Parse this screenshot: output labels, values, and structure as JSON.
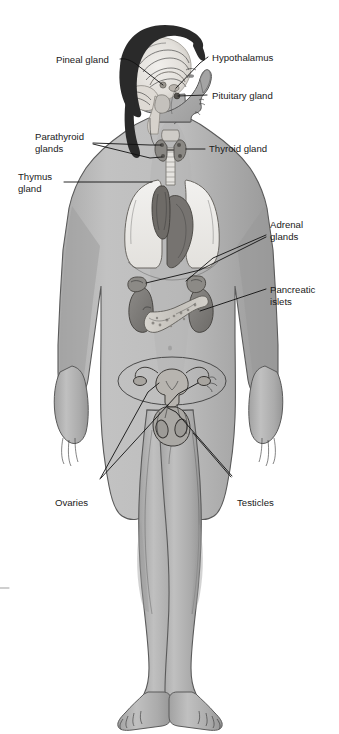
{
  "figure": {
    "name": "endocrine-system-diagram",
    "background_color": "#ffffff",
    "body_fill": "#b8b8b8",
    "body_shadow": "#9d9d9d",
    "outline_color": "#4a4a4a",
    "label_color": "#1a1a1a",
    "leader_color": "#111111"
  },
  "labels": {
    "pineal": "Pineal gland",
    "hypothalamus": "Hypothalamus",
    "pituitary": "Pituitary gland",
    "parathyroid_line1": "Parathyroid",
    "parathyroid_line2": "glands",
    "thyroid": "Thyroid gland",
    "thymus_line1": "Thymus",
    "thymus_line2": "gland",
    "adrenal_line1": "Adrenal",
    "adrenal_line2": "glands",
    "pancreatic_line1": "Pancreatic",
    "pancreatic_line2": "islets",
    "ovaries": "Ovaries",
    "testicles": "Testicles"
  },
  "organs": [
    {
      "name": "pineal-gland",
      "label": "Pineal gland",
      "region": "brain",
      "fill": "#e8e6e2"
    },
    {
      "name": "hypothalamus",
      "label": "Hypothalamus",
      "region": "brain",
      "fill": "#ddd9d3"
    },
    {
      "name": "pituitary-gland",
      "label": "Pituitary gland",
      "region": "brain",
      "fill": "#d2cdc6"
    },
    {
      "name": "thyroid-gland",
      "label": "Thyroid gland",
      "region": "neck",
      "fill": "#8f8f8f"
    },
    {
      "name": "parathyroid-glands",
      "label": "Parathyroid glands",
      "region": "neck",
      "fill": "#6e6e6e"
    },
    {
      "name": "thymus-gland",
      "label": "Thymus gland",
      "region": "thorax",
      "fill": "#7d7a76"
    },
    {
      "name": "adrenal-glands",
      "label": "Adrenal glands",
      "region": "abdomen",
      "fill": "#9a9a9a"
    },
    {
      "name": "pancreatic-islets",
      "label": "Pancreatic islets",
      "region": "abdomen",
      "fill": "#c9c6c0"
    },
    {
      "name": "ovaries",
      "label": "Ovaries",
      "region": "pelvis",
      "fill": "#b0aeaa"
    },
    {
      "name": "testicles",
      "label": "Testicles",
      "region": "pelvis",
      "fill": "#a8a6a2"
    }
  ]
}
